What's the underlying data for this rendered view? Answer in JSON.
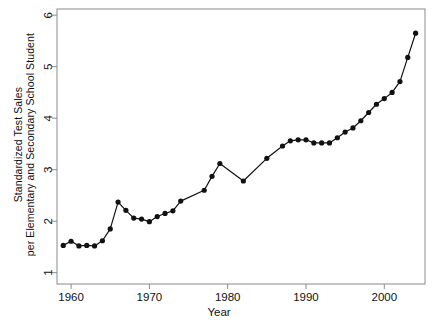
{
  "chart_data": {
    "type": "line",
    "title": "",
    "subtitle": "",
    "xlabel": "Year",
    "ylabel": "Standardized Test Sales per Elementary and Secondary School Student",
    "ylabel_line1": "Standardized Test Sales",
    "ylabel_line2": "per Elementary and Secondary School Student",
    "xlim": [
      1958.2,
      2005.2
    ],
    "ylim": [
      0.78,
      6.12
    ],
    "xticks": [
      1960,
      1970,
      1980,
      1990,
      2000
    ],
    "xtick_labels": [
      "1960",
      "1970",
      "1980",
      "1990",
      "2000"
    ],
    "yticks": [
      1,
      2,
      3,
      4,
      5,
      6
    ],
    "ytick_labels": [
      "1",
      "2",
      "3",
      "4",
      "5",
      "6"
    ],
    "grid": false,
    "legend": false,
    "legend_position": "none",
    "marker": "filled-circle",
    "line_color": "#111111",
    "marker_color": "#111111",
    "frame_color": "#8a8a8a",
    "background": "#ffffff",
    "x": [
      1959,
      1960,
      1961,
      1962,
      1963,
      1964,
      1965,
      1966,
      1967,
      1968,
      1969,
      1970,
      1971,
      1972,
      1973,
      1974,
      1977,
      1978,
      1979,
      1982,
      1985,
      1987,
      1988,
      1989,
      1990,
      1991,
      1992,
      1993,
      1994,
      1995,
      1996,
      1997,
      1998,
      1999,
      2000,
      2001,
      2002,
      2003,
      2004
    ],
    "y": [
      1.53,
      1.61,
      1.52,
      1.53,
      1.52,
      1.62,
      1.85,
      2.37,
      2.21,
      2.06,
      2.04,
      1.99,
      2.09,
      2.15,
      2.2,
      2.39,
      2.6,
      2.87,
      3.12,
      2.78,
      3.22,
      3.46,
      3.56,
      3.58,
      3.58,
      3.52,
      3.52,
      3.52,
      3.62,
      3.73,
      3.81,
      3.95,
      4.11,
      4.27,
      4.38,
      4.5,
      4.71,
      5.18,
      5.65
    ],
    "series": [
      {
        "name": "Standardized Test Sales per Student",
        "values": [
          1.53,
          1.61,
          1.52,
          1.53,
          1.52,
          1.62,
          1.85,
          2.37,
          2.21,
          2.06,
          2.04,
          1.99,
          2.09,
          2.15,
          2.2,
          2.39,
          2.6,
          2.87,
          3.12,
          2.78,
          3.22,
          3.46,
          3.56,
          3.58,
          3.58,
          3.52,
          3.52,
          3.52,
          3.62,
          3.73,
          3.81,
          3.95,
          4.11,
          4.27,
          4.38,
          4.5,
          4.71,
          5.18,
          5.65
        ]
      }
    ],
    "annotations": []
  }
}
